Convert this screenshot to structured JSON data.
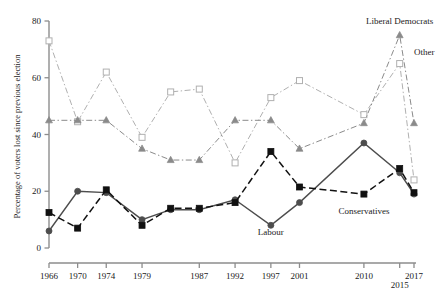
{
  "chart_data": {
    "type": "line",
    "title": "",
    "xlabel": "",
    "ylabel": "Percentage of voters lost since previous election",
    "ylim": [
      0,
      80
    ],
    "yticks": [
      0,
      20,
      40,
      60,
      80
    ],
    "ytick_labels": [
      "0",
      "20",
      "40",
      "60",
      "80"
    ],
    "grid": false,
    "legend": "inline-annotations",
    "x": [
      1966,
      1970,
      1974,
      1979,
      1983,
      1987,
      1992,
      1997,
      2001,
      2010,
      2015,
      2017
    ],
    "xtick_labels": [
      "1966",
      "1970",
      "1974",
      "1979",
      "1987",
      "1992",
      "1997",
      "2001",
      "2010",
      "2015",
      "2017"
    ],
    "xticks": [
      1966,
      1970,
      1974,
      1979,
      1987,
      1992,
      1997,
      2001,
      2010,
      2015,
      2017
    ],
    "series": [
      {
        "name": "Labour",
        "marker": "circle-filled",
        "color": "#4d4d4d",
        "line": "solid",
        "values": [
          6,
          20,
          19.5,
          10,
          13.5,
          13.5,
          17,
          8,
          16,
          37,
          26.5,
          19
        ]
      },
      {
        "name": "Conservatives",
        "marker": "square-filled",
        "color": "#111111",
        "line": "dashed",
        "values": [
          12.5,
          7,
          20.5,
          8,
          14,
          14,
          16,
          34,
          21.5,
          19,
          28,
          19.5
        ]
      },
      {
        "name": "Liberal Democrats",
        "marker": "triangle-filled",
        "color": "#8a8a8a",
        "line": "dash-dot",
        "values": [
          45,
          45,
          45,
          35,
          31,
          31,
          45,
          45,
          35,
          44,
          75,
          44
        ]
      },
      {
        "name": "Other",
        "marker": "square-open",
        "color": "#b0b0b0",
        "line": "dash-dot",
        "values": [
          73,
          44.5,
          62,
          39,
          55,
          56,
          30,
          53,
          59,
          47,
          65,
          24
        ]
      }
    ],
    "annotations": [
      {
        "text": "Liberal Democrats",
        "x": 2015,
        "y": 79,
        "anchor": "middle"
      },
      {
        "text": "Other",
        "x": 2017,
        "y": 68,
        "anchor": "start"
      },
      {
        "text": "Labour",
        "x": 1997,
        "y": 4.5,
        "anchor": "middle"
      },
      {
        "text": "Conservatives",
        "x": 2010,
        "y": 12,
        "anchor": "middle"
      }
    ]
  }
}
